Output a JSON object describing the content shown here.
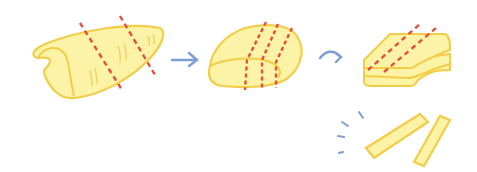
{
  "illustration": {
    "subject": "cutting potato into fries steps",
    "steps": [
      "whole-potato-with-cut-lines",
      "trimmed-block-with-cut-lines",
      "stacked-slices-with-cut-lines",
      "fries-sticks"
    ],
    "colors": {
      "fill": "#fdf3a6",
      "outline": "#f2cd4a",
      "cut": "#e0503a",
      "arrow": "#7d9ed2",
      "background": "#ffffff"
    }
  }
}
